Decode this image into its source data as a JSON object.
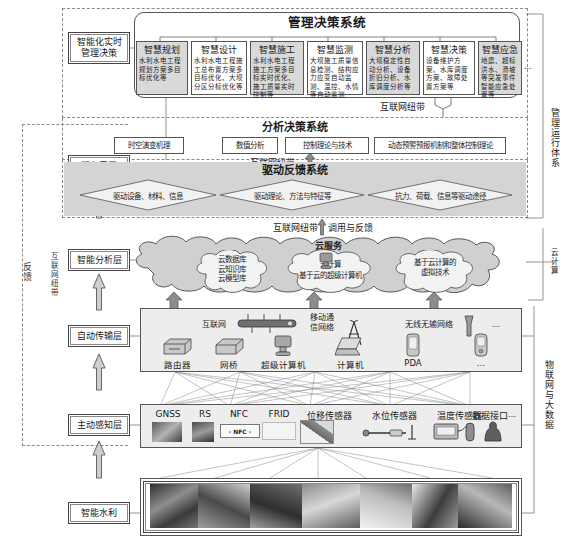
{
  "left_side": {
    "feedback_label": "反馈",
    "internet_band_label": "互联网纽带",
    "layers": [
      {
        "name": "layer-intelligent-realtime-decision",
        "label": "智能化实时\n管理决策"
      },
      {
        "name": "layer-service-sublayer",
        "label": "服务子层"
      },
      {
        "name": "layer-intelligent-analysis",
        "label": "智能分析层"
      },
      {
        "name": "layer-auto-transmission",
        "label": "自动传输层"
      },
      {
        "name": "layer-active-sensing",
        "label": "主动感知层"
      },
      {
        "name": "layer-smart-water",
        "label": "智能水利"
      }
    ]
  },
  "right_side": {
    "management_system": "管理运行体系",
    "cloud_computing": "云计算",
    "iot_bigdata": "物联网与大数据"
  },
  "management": {
    "title": "管理决策系统",
    "ellipsis": "…",
    "modules": [
      {
        "title": "智慧规划",
        "desc": "水利水电工程规划方案多目标优化等",
        "shaded": true
      },
      {
        "title": "智慧设计",
        "desc": "水利水电工程施工总布置方案多目标优化、大坝分区分标优化等",
        "shaded": false
      },
      {
        "title": "智慧施工",
        "desc": "水利水电工程施工方案多目标实时优化、施工质量实时控制等",
        "shaded": true
      },
      {
        "title": "智慧监测",
        "desc": "大坝施工质量信息检测、结构应力应变自动监测、温控、水情等自动监测",
        "shaded": false
      },
      {
        "title": "智慧分析",
        "desc": "大坝稳定性自动分析、设备折旧分析、水库调度分析等",
        "shaded": true
      },
      {
        "title": "智慧决策",
        "desc": "设备维护方案、水库调度方案、故障处置方案等",
        "shaded": false
      },
      {
        "title": "智慧应急",
        "desc": "地震、超标洪水、滑坡等突发事件智能应急处置等",
        "shaded": true
      }
    ]
  },
  "band_top": "互联网纽带",
  "analysis": {
    "title": "分析决策系统",
    "items": [
      "时空演变机理",
      "数值分析",
      "控制理论与技术",
      "动态预警预报机制和整体控制理论"
    ]
  },
  "band_mid": "互联网纽带",
  "drive": {
    "title": "驱动反馈系统",
    "items": [
      "驱动设备、材料、信息",
      "驱动理论、方法与特征等",
      "抗力、荷载、信息等驱动途径"
    ]
  },
  "band_cloud": {
    "left": "互联网纽带",
    "right": "调用与反馈"
  },
  "cloud": {
    "title": "云服务",
    "bubbles": [
      {
        "name": "cloud-bubble-databases",
        "lines": "云数据库\n云知识库\n云模型库"
      },
      {
        "name": "cloud-bubble-computing",
        "lines": "云计算\n基于云的超级计算机"
      },
      {
        "name": "cloud-bubble-virtualization",
        "lines": "基于云计算的\n虚拟技术"
      }
    ]
  },
  "transmission": {
    "network_labels": [
      {
        "name": "label-internet",
        "text": "互联网"
      },
      {
        "name": "label-mobile-network",
        "text": "移动通\n信网络"
      },
      {
        "name": "label-wireless-network",
        "text": "无线无输网络"
      },
      {
        "name": "label-transmission-ellipsis",
        "text": "…"
      }
    ],
    "devices": [
      {
        "name": "device-router",
        "text": "路由器"
      },
      {
        "name": "device-bridge",
        "text": "网桥"
      },
      {
        "name": "device-supercomputer",
        "text": "超级计算机"
      },
      {
        "name": "device-computer",
        "text": "计算机"
      },
      {
        "name": "device-pda",
        "text": "PDA"
      },
      {
        "name": "device-ellipsis",
        "text": "…"
      }
    ]
  },
  "sensing": {
    "items": [
      {
        "name": "sensor-gnss",
        "text": "GNSS"
      },
      {
        "name": "sensor-rs",
        "text": "RS"
      },
      {
        "name": "sensor-nfc",
        "text": "NFC"
      },
      {
        "name": "sensor-frid",
        "text": "FRID"
      },
      {
        "name": "sensor-displacement",
        "text": "位移传感器"
      },
      {
        "name": "sensor-water-level",
        "text": "水位传感器"
      },
      {
        "name": "sensor-temperature",
        "text": "温度传感器"
      },
      {
        "name": "sensor-data-interface",
        "text": "数据接口"
      },
      {
        "name": "sensor-ellipsis",
        "text": "…"
      }
    ],
    "nfc_chip_text": "‹ NFC ›"
  },
  "colors": {
    "shaded_box": "#d9d9d9",
    "light_panel": "#efefef",
    "drive_panel": "#d4d4d4",
    "cloud_fill": "#d0d0d0",
    "border": "#555555",
    "photo_fill": "#8e8e8e"
  }
}
